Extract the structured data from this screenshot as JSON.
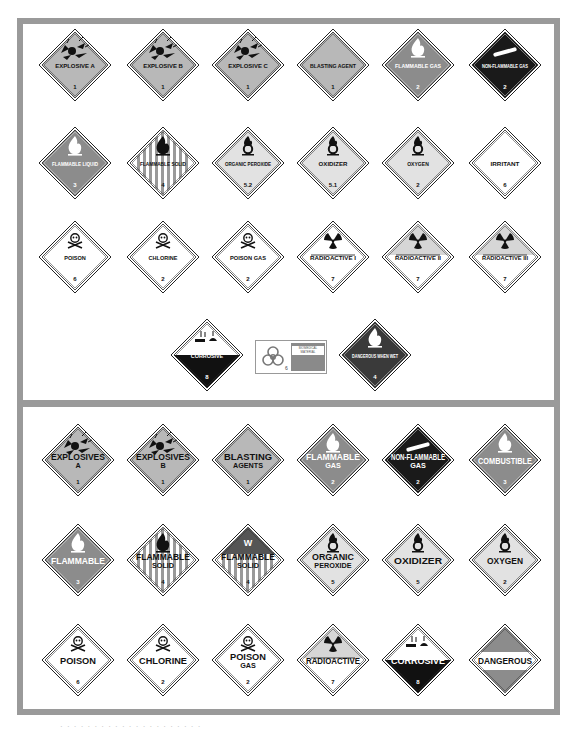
{
  "colors": {
    "frame": "#9a9a9a",
    "orange_gray": "#b8b8b8",
    "red_gray": "#8c8c8c",
    "green_black": "#1a1a1a",
    "white": "#ffffff",
    "yellow_gray": "#d8d8d8"
  },
  "top_panel": {
    "rows": [
      [
        {
          "label": "EXPLOSIVE A",
          "class_num": "1",
          "icon": "explosion-icon",
          "style": "explosive"
        },
        {
          "label": "EXPLOSIVE B",
          "class_num": "1",
          "icon": "explosion-icon",
          "style": "explosive"
        },
        {
          "label": "EXPLOSIVE C",
          "class_num": "1",
          "icon": "explosion-icon",
          "style": "explosive"
        },
        {
          "label": "BLASTING AGENT",
          "class_num": "1",
          "icon": "",
          "style": "explosive"
        },
        {
          "label": "FLAMMABLE GAS",
          "class_num": "2",
          "icon": "flame-icon",
          "style": "red"
        },
        {
          "label": "NON-FLAMMABLE GAS",
          "class_num": "2",
          "icon": "gas-cylinder-icon",
          "style": "black"
        }
      ],
      [
        {
          "label": "FLAMMABLE LIQUID",
          "class_num": "3",
          "icon": "flame-icon",
          "style": "red"
        },
        {
          "label": "FLAMMABLE SOLID",
          "class_num": "4",
          "icon": "flame-icon",
          "style": "striped"
        },
        {
          "label": "ORGANIC PEROXIDE",
          "class_num": "5.2",
          "icon": "flame-over-circle-icon",
          "style": "yellow"
        },
        {
          "label": "OXIDIZER",
          "class_num": "5.1",
          "icon": "flame-over-circle-icon",
          "style": "yellow"
        },
        {
          "label": "OXYGEN",
          "class_num": "2",
          "icon": "flame-over-circle-icon",
          "style": "yellow"
        },
        {
          "label": "IRRITANT",
          "class_num": "6",
          "icon": "",
          "style": "white"
        }
      ],
      [
        {
          "label": "POISON",
          "class_num": "6",
          "icon": "skull-crossbones-icon",
          "style": "white"
        },
        {
          "label": "CHLORINE",
          "class_num": "2",
          "icon": "skull-crossbones-icon",
          "style": "white"
        },
        {
          "label": "POISON GAS",
          "class_num": "2",
          "icon": "skull-crossbones-icon",
          "style": "white"
        },
        {
          "label": "RADIOACTIVE I",
          "class_num": "7",
          "icon": "trefoil-icon",
          "style": "radioactive-white"
        },
        {
          "label": "RADIOACTIVE II",
          "class_num": "7",
          "icon": "trefoil-icon",
          "style": "radioactive-yellow"
        },
        {
          "label": "RADIOACTIVE III",
          "class_num": "7",
          "icon": "trefoil-icon",
          "style": "radioactive-yellow"
        }
      ],
      [
        {
          "label": "CORROSIVE",
          "class_num": "8",
          "icon": "corrosion-icon",
          "style": "corrosive"
        },
        {
          "label": "BIOMEDICAL MATERIAL",
          "class_num": "6",
          "icon": "biohazard-icon",
          "style": "bio-label"
        },
        {
          "label": "DANGEROUS WHEN WET",
          "class_num": "4",
          "icon": "flame-icon",
          "style": "blue"
        }
      ]
    ]
  },
  "bottom_panel": {
    "rows": [
      [
        {
          "label": "EXPLOSIVES",
          "sub": "A",
          "class_num": "1",
          "icon": "explosion-icon",
          "style": "explosive"
        },
        {
          "label": "EXPLOSIVES",
          "sub": "B",
          "class_num": "1",
          "icon": "explosion-icon",
          "style": "explosive"
        },
        {
          "label": "BLASTING",
          "sub": "AGENTS",
          "class_num": "1",
          "icon": "",
          "style": "explosive"
        },
        {
          "label": "FLAMMABLE",
          "sub": "GAS",
          "class_num": "2",
          "icon": "flame-icon",
          "style": "red"
        },
        {
          "label": "NON-FLAMMABLE",
          "sub": "GAS",
          "class_num": "2",
          "icon": "gas-cylinder-icon",
          "style": "black"
        },
        {
          "label": "COMBUSTIBLE",
          "sub": "",
          "class_num": "3",
          "icon": "flame-icon",
          "style": "red"
        }
      ],
      [
        {
          "label": "FLAMMABLE",
          "sub": "",
          "class_num": "3",
          "icon": "flame-icon",
          "style": "red"
        },
        {
          "label": "FLAMMABLE",
          "sub": "SOLID",
          "class_num": "4",
          "icon": "flame-icon",
          "style": "striped"
        },
        {
          "label": "FLAMMABLE",
          "sub": "SOLID",
          "class_num": "4",
          "icon": "w-icon",
          "style": "striped-wet"
        },
        {
          "label": "ORGANIC",
          "sub": "PEROXIDE",
          "class_num": "5",
          "icon": "flame-over-circle-icon",
          "style": "yellow"
        },
        {
          "label": "OXIDIZER",
          "sub": "",
          "class_num": "5",
          "icon": "flame-over-circle-icon",
          "style": "yellow"
        },
        {
          "label": "OXYGEN",
          "sub": "",
          "class_num": "2",
          "icon": "flame-over-circle-icon",
          "style": "yellow"
        }
      ],
      [
        {
          "label": "POISON",
          "sub": "",
          "class_num": "6",
          "icon": "skull-crossbones-icon",
          "style": "white"
        },
        {
          "label": "CHLORINE",
          "sub": "",
          "class_num": "2",
          "icon": "skull-crossbones-icon",
          "style": "white"
        },
        {
          "label": "POISON",
          "sub": "GAS",
          "class_num": "2",
          "icon": "skull-crossbones-icon",
          "style": "white"
        },
        {
          "label": "RADIOACTIVE",
          "sub": "",
          "class_num": "7",
          "icon": "trefoil-icon",
          "style": "radioactive-yellow"
        },
        {
          "label": "CORROSIVE",
          "sub": "",
          "class_num": "8",
          "icon": "corrosion-icon",
          "style": "corrosive"
        },
        {
          "label": "DANGEROUS",
          "sub": "",
          "class_num": "",
          "icon": "",
          "style": "dangerous"
        }
      ]
    ]
  },
  "caption": "· · · · · · · · · · · · · · · · · · · · ·"
}
